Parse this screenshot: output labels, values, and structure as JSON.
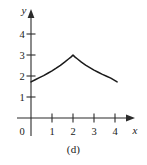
{
  "figure": {
    "caption": "(d)",
    "axis_color": "#2b2b2b",
    "curve_color": "#1a1a1a",
    "background": "#ffffff"
  },
  "axes": {
    "x_label": "x",
    "y_label": "y",
    "origin_label": "0"
  },
  "chart_data": {
    "type": "line",
    "title": "",
    "subtitle": "",
    "xlabel": "x",
    "ylabel": "y",
    "xlim": [
      0,
      4.35
    ],
    "ylim": [
      0,
      4.6
    ],
    "xticks": [
      1,
      2,
      3,
      4
    ],
    "xticklabels": [
      "1",
      "2",
      "3",
      "4"
    ],
    "yticks": [
      1,
      2,
      3,
      4
    ],
    "yticklabels": [
      "1",
      "2",
      "3",
      "4"
    ],
    "origin_label": "0",
    "grid": false,
    "legend": null,
    "annotations": [
      "cusp peak at (2, 3)"
    ],
    "series": [
      {
        "name": "curve",
        "x": [
          0.0,
          0.2,
          0.4,
          0.6,
          0.8,
          1.0,
          1.2,
          1.4,
          1.6,
          1.8,
          1.9,
          2.0,
          2.1,
          2.2,
          2.4,
          2.6,
          2.8,
          3.0,
          3.2,
          3.4,
          3.6,
          3.8,
          4.0,
          4.1
        ],
        "y": [
          1.72,
          1.82,
          1.92,
          2.02,
          2.13,
          2.24,
          2.37,
          2.51,
          2.66,
          2.82,
          2.9,
          3.0,
          2.9,
          2.82,
          2.66,
          2.52,
          2.4,
          2.28,
          2.18,
          2.08,
          1.99,
          1.9,
          1.78,
          1.72
        ]
      }
    ]
  }
}
